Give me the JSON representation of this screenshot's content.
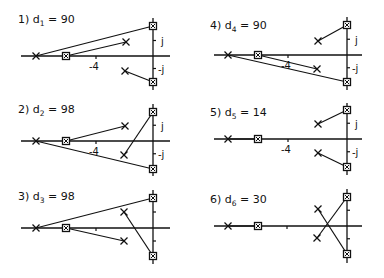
{
  "figure": {
    "panels": [
      {
        "id": 1,
        "label_num": "1)",
        "label_var": "d",
        "label_sub": "1",
        "label_val": "= 90",
        "axis_tick_label": "-4",
        "imag_labels": [
          "j",
          "-j"
        ],
        "origin": [
          153,
          56
        ],
        "real_start": 21,
        "real_end": 170,
        "imag_top": 18,
        "imag_bottom": 90,
        "tick_x": 96,
        "show_tick_label": true,
        "show_imag_labels": true,
        "label_pos": [
          18,
          23
        ],
        "poles": [
          [
            36,
            56
          ],
          [
            126,
            42
          ],
          [
            125,
            71
          ]
        ],
        "zeros": [
          [
            66,
            56
          ],
          [
            153,
            26
          ],
          [
            153,
            82
          ]
        ],
        "branches": [
          [
            36,
            56,
            153,
            26
          ],
          [
            66,
            56,
            126,
            42
          ],
          [
            125,
            71,
            153,
            82
          ]
        ]
      },
      {
        "id": 2,
        "label_num": "2)",
        "label_var": "d",
        "label_sub": "2",
        "label_val": "= 98",
        "axis_tick_label": "-4",
        "imag_labels": [
          "j",
          "-j"
        ],
        "origin": [
          153,
          141
        ],
        "real_start": 21,
        "real_end": 170,
        "imag_top": 104,
        "imag_bottom": 176,
        "tick_x": 96,
        "show_tick_label": true,
        "show_imag_labels": true,
        "label_pos": [
          18,
          113
        ],
        "poles": [
          [
            36,
            141
          ],
          [
            125,
            126
          ],
          [
            124,
            155
          ]
        ],
        "zeros": [
          [
            66,
            141
          ],
          [
            153,
            112
          ],
          [
            153,
            169
          ]
        ],
        "branches": [
          [
            66,
            141,
            125,
            126
          ],
          [
            36,
            141,
            153,
            169
          ],
          [
            124,
            155,
            153,
            112
          ]
        ]
      },
      {
        "id": 3,
        "label_num": "3)",
        "label_var": "d",
        "label_sub": "3",
        "label_val": "= 98",
        "axis_tick_label": "",
        "imag_labels": [
          "",
          ""
        ],
        "origin": [
          153,
          228
        ],
        "real_start": 21,
        "real_end": 170,
        "imag_top": 190,
        "imag_bottom": 264,
        "tick_x": 96,
        "show_tick_label": false,
        "show_imag_labels": false,
        "label_pos": [
          18,
          200
        ],
        "poles": [
          [
            36,
            228
          ],
          [
            124,
            212
          ],
          [
            124,
            241
          ]
        ],
        "zeros": [
          [
            66,
            228
          ],
          [
            153,
            198
          ],
          [
            153,
            256
          ]
        ],
        "branches": [
          [
            36,
            228,
            153,
            198
          ],
          [
            66,
            228,
            124,
            241
          ],
          [
            124,
            212,
            153,
            256
          ]
        ]
      },
      {
        "id": 4,
        "label_num": "4)",
        "label_var": "d",
        "label_sub": "4",
        "label_val": "= 90",
        "axis_tick_label": "-4",
        "imag_labels": [
          "j",
          "-j"
        ],
        "origin": [
          347,
          55
        ],
        "real_start": 214,
        "real_end": 362,
        "imag_top": 17,
        "imag_bottom": 90,
        "tick_x": 288,
        "show_tick_label": true,
        "show_imag_labels": true,
        "label_pos": [
          210,
          29
        ],
        "poles": [
          [
            228,
            55
          ],
          [
            318,
            41
          ],
          [
            317,
            69
          ]
        ],
        "zeros": [
          [
            258,
            55
          ],
          [
            347,
            25
          ],
          [
            347,
            82
          ]
        ],
        "branches": [
          [
            318,
            41,
            347,
            25
          ],
          [
            258,
            55,
            317,
            69
          ],
          [
            228,
            55,
            347,
            82
          ]
        ]
      },
      {
        "id": 5,
        "label_num": "5)",
        "label_var": "d",
        "label_sub": "5",
        "label_val": "= 14",
        "axis_tick_label": "-4",
        "imag_labels": [
          "j",
          "-j"
        ],
        "origin": [
          347,
          139
        ],
        "real_start": 214,
        "real_end": 362,
        "imag_top": 103,
        "imag_bottom": 175,
        "tick_x": 288,
        "show_tick_label": true,
        "show_imag_labels": true,
        "label_pos": [
          210,
          116
        ],
        "poles": [
          [
            228,
            139
          ],
          [
            318,
            124
          ],
          [
            318,
            153
          ]
        ],
        "zeros": [
          [
            258,
            139
          ],
          [
            347,
            110
          ],
          [
            347,
            167
          ]
        ],
        "branches": [
          [
            228,
            139,
            258,
            139
          ],
          [
            318,
            124,
            347,
            110
          ],
          [
            318,
            153,
            347,
            167
          ]
        ]
      },
      {
        "id": 6,
        "label_num": "6)",
        "label_var": "d",
        "label_sub": "6",
        "label_val": "= 30",
        "axis_tick_label": "",
        "imag_labels": [
          "",
          ""
        ],
        "origin": [
          347,
          226
        ],
        "real_start": 214,
        "real_end": 362,
        "imag_top": 189,
        "imag_bottom": 263,
        "tick_x": 287,
        "show_tick_label": false,
        "show_imag_labels": false,
        "label_pos": [
          210,
          203
        ],
        "poles": [
          [
            228,
            226
          ],
          [
            318,
            209
          ],
          [
            317,
            238
          ]
        ],
        "zeros": [
          [
            258,
            226
          ],
          [
            347,
            197
          ],
          [
            347,
            254
          ]
        ],
        "branches": [
          [
            228,
            226,
            258,
            226
          ],
          [
            318,
            209,
            347,
            254
          ],
          [
            317,
            238,
            347,
            197
          ]
        ]
      }
    ]
  }
}
